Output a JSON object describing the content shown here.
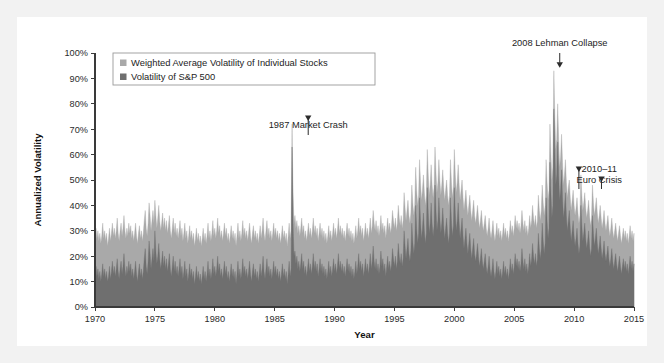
{
  "figure": {
    "background_color": "#f2f2f2",
    "card_color": "#ffffff"
  },
  "chart_data": {
    "type": "area",
    "title": "",
    "xlabel": "Year",
    "ylabel": "Annualized Volatility",
    "xlim": [
      1970,
      2015
    ],
    "ylim": [
      0,
      100
    ],
    "grid": false,
    "legend_position": "top-left",
    "xticks": [
      1970,
      1975,
      1980,
      1985,
      1990,
      1995,
      2000,
      2005,
      2010,
      2015
    ],
    "xtick_labels": [
      "1970",
      "1975",
      "1980",
      "1985",
      "1990",
      "1995",
      "2000",
      "2005",
      "2010",
      "2015"
    ],
    "yticks": [
      0,
      10,
      20,
      30,
      40,
      50,
      60,
      70,
      80,
      90,
      100
    ],
    "ytick_labels": [
      "0%",
      "10%",
      "20%",
      "30%",
      "40%",
      "50%",
      "60%",
      "70%",
      "80%",
      "90%",
      "100%"
    ],
    "colors": {
      "individual_stocks": "#a9a9a9",
      "sp500": "#6f6f6f"
    },
    "series": [
      {
        "name": "Weighted Average Volatility of Individual Stocks",
        "color": "#a9a9a9",
        "values": [
          28,
          31,
          27,
          30,
          26,
          29,
          25,
          28,
          33,
          27,
          30,
          26,
          29,
          24,
          27,
          31,
          26,
          29,
          33,
          28,
          31,
          27,
          30,
          35,
          29,
          26,
          30,
          33,
          28,
          31,
          36,
          30,
          27,
          31,
          28,
          33,
          29,
          32,
          27,
          30,
          26,
          29,
          33,
          28,
          25,
          29,
          32,
          27,
          30,
          26,
          29,
          34,
          38,
          31,
          28,
          33,
          41,
          36,
          30,
          34,
          38,
          33,
          42,
          36,
          31,
          35,
          40,
          34,
          30,
          33,
          37,
          31,
          35,
          30,
          34,
          29,
          32,
          36,
          30,
          27,
          31,
          35,
          29,
          33,
          28,
          31,
          27,
          30,
          34,
          28,
          31,
          26,
          29,
          33,
          27,
          30,
          25,
          28,
          32,
          27,
          30,
          26,
          29,
          24,
          27,
          31,
          26,
          29,
          25,
          28,
          24,
          27,
          31,
          26,
          29,
          25,
          28,
          33,
          27,
          30,
          26,
          29,
          34,
          28,
          31,
          27,
          30,
          35,
          29,
          32,
          27,
          30,
          26,
          29,
          33,
          28,
          31,
          26,
          29,
          25,
          28,
          32,
          27,
          30,
          26,
          29,
          24,
          28,
          33,
          27,
          30,
          26,
          29,
          34,
          28,
          31,
          27,
          30,
          26,
          29,
          33,
          28,
          25,
          29,
          32,
          27,
          30,
          26,
          29,
          25,
          28,
          32,
          27,
          30,
          35,
          29,
          26,
          30,
          34,
          28,
          31,
          27,
          30,
          26,
          29,
          33,
          28,
          31,
          27,
          30,
          26,
          29,
          25,
          28,
          32,
          27,
          30,
          26,
          29,
          24,
          28,
          33,
          27,
          30,
          72,
          45,
          33,
          36,
          31,
          34,
          29,
          32,
          28,
          31,
          35,
          29,
          32,
          27,
          30,
          26,
          29,
          33,
          28,
          31,
          27,
          30,
          35,
          29,
          32,
          28,
          31,
          26,
          29,
          33,
          28,
          31,
          27,
          30,
          26,
          29,
          25,
          28,
          32,
          27,
          30,
          26,
          29,
          33,
          28,
          31,
          27,
          30,
          35,
          29,
          32,
          28,
          31,
          27,
          30,
          26,
          29,
          33,
          28,
          31,
          27,
          30,
          26,
          29,
          25,
          28,
          32,
          27,
          30,
          35,
          29,
          32,
          28,
          31,
          26,
          29,
          33,
          28,
          31,
          27,
          30,
          35,
          29,
          32,
          38,
          33,
          30,
          34,
          29,
          32,
          28,
          31,
          36,
          30,
          33,
          29,
          32,
          27,
          31,
          35,
          30,
          33,
          29,
          32,
          38,
          34,
          31,
          35,
          30,
          33,
          40,
          35,
          32,
          36,
          31,
          34,
          45,
          39,
          34,
          38,
          42,
          36,
          33,
          37,
          48,
          41,
          36,
          40,
          55,
          46,
          40,
          44,
          58,
          49,
          42,
          46,
          52,
          45,
          40,
          44,
          62,
          52,
          44,
          48,
          56,
          48,
          43,
          47,
          63,
          53,
          45,
          49,
          58,
          50,
          44,
          48,
          54,
          47,
          42,
          46,
          50,
          44,
          40,
          44,
          58,
          49,
          43,
          47,
          62,
          52,
          45,
          49,
          56,
          48,
          42,
          46,
          50,
          43,
          38,
          42,
          46,
          40,
          36,
          40,
          44,
          38,
          34,
          38,
          42,
          36,
          33,
          36,
          40,
          35,
          31,
          34,
          38,
          33,
          30,
          33,
          36,
          31,
          28,
          31,
          35,
          30,
          27,
          30,
          34,
          29,
          26,
          29,
          33,
          28,
          31,
          27,
          30,
          26,
          29,
          33,
          28,
          31,
          27,
          30,
          26,
          29,
          34,
          29,
          32,
          28,
          31,
          36,
          31,
          34,
          30,
          33,
          29,
          32,
          38,
          33,
          30,
          34,
          29,
          32,
          28,
          31,
          36,
          31,
          34,
          40,
          35,
          32,
          36,
          31,
          34,
          44,
          38,
          34,
          38,
          48,
          41,
          36,
          40,
          58,
          49,
          42,
          46,
          72,
          60,
          50,
          55,
          93,
          76,
          62,
          66,
          80,
          66,
          55,
          59,
          68,
          57,
          48,
          52,
          58,
          49,
          43,
          47,
          50,
          43,
          38,
          42,
          46,
          40,
          36,
          39,
          43,
          37,
          33,
          36,
          52,
          44,
          38,
          41,
          45,
          39,
          35,
          38,
          42,
          36,
          32,
          35,
          48,
          41,
          36,
          39,
          43,
          37,
          33,
          36,
          40,
          35,
          31,
          34,
          38,
          33,
          30,
          33,
          36,
          31,
          28,
          31,
          35,
          30,
          27,
          30,
          33,
          29,
          26,
          29,
          32,
          28,
          25,
          28,
          31,
          27,
          30,
          26,
          29,
          25,
          28,
          32,
          27,
          30,
          26,
          29
        ]
      },
      {
        "name": "Volatility of S&P 500",
        "color": "#6f6f6f",
        "values": [
          13,
          16,
          12,
          15,
          11,
          14,
          10,
          13,
          17,
          12,
          15,
          11,
          14,
          10,
          12,
          16,
          11,
          14,
          18,
          13,
          16,
          12,
          15,
          19,
          14,
          11,
          15,
          18,
          13,
          16,
          21,
          15,
          12,
          16,
          13,
          18,
          14,
          17,
          12,
          15,
          11,
          14,
          18,
          13,
          10,
          14,
          17,
          12,
          15,
          11,
          14,
          19,
          23,
          16,
          13,
          18,
          26,
          21,
          15,
          19,
          23,
          18,
          30,
          22,
          17,
          20,
          25,
          19,
          15,
          18,
          22,
          16,
          20,
          15,
          19,
          14,
          17,
          21,
          15,
          12,
          16,
          20,
          14,
          18,
          13,
          16,
          12,
          15,
          19,
          13,
          16,
          11,
          14,
          18,
          12,
          15,
          10,
          13,
          17,
          12,
          15,
          11,
          14,
          9,
          12,
          16,
          11,
          14,
          10,
          13,
          9,
          12,
          16,
          11,
          14,
          10,
          13,
          18,
          12,
          15,
          11,
          14,
          19,
          13,
          16,
          12,
          15,
          20,
          14,
          17,
          12,
          15,
          11,
          14,
          18,
          13,
          16,
          11,
          14,
          10,
          13,
          17,
          12,
          15,
          11,
          14,
          9,
          13,
          18,
          12,
          15,
          11,
          14,
          19,
          13,
          16,
          12,
          15,
          11,
          14,
          18,
          13,
          10,
          14,
          17,
          12,
          15,
          11,
          14,
          10,
          13,
          17,
          12,
          15,
          20,
          14,
          11,
          15,
          19,
          13,
          16,
          12,
          15,
          11,
          14,
          18,
          13,
          16,
          12,
          15,
          11,
          14,
          10,
          13,
          17,
          12,
          15,
          11,
          14,
          9,
          13,
          18,
          12,
          15,
          63,
          33,
          20,
          22,
          17,
          20,
          15,
          18,
          14,
          17,
          21,
          15,
          18,
          13,
          16,
          12,
          15,
          19,
          14,
          17,
          13,
          16,
          21,
          15,
          18,
          14,
          17,
          12,
          15,
          19,
          14,
          17,
          13,
          16,
          12,
          15,
          11,
          14,
          18,
          13,
          16,
          12,
          15,
          19,
          14,
          17,
          13,
          16,
          21,
          15,
          18,
          14,
          17,
          13,
          16,
          12,
          15,
          19,
          14,
          17,
          13,
          16,
          12,
          15,
          11,
          14,
          18,
          13,
          16,
          21,
          15,
          18,
          14,
          17,
          12,
          15,
          19,
          14,
          17,
          13,
          16,
          21,
          15,
          18,
          24,
          18,
          15,
          19,
          14,
          17,
          13,
          16,
          22,
          16,
          19,
          14,
          17,
          12,
          16,
          20,
          15,
          18,
          14,
          17,
          23,
          19,
          16,
          20,
          15,
          18,
          25,
          20,
          17,
          21,
          16,
          19,
          30,
          24,
          19,
          23,
          27,
          21,
          18,
          22,
          33,
          26,
          21,
          25,
          40,
          31,
          25,
          29,
          43,
          34,
          27,
          31,
          37,
          30,
          25,
          29,
          47,
          37,
          29,
          33,
          41,
          33,
          28,
          32,
          48,
          38,
          30,
          34,
          43,
          35,
          29,
          33,
          39,
          32,
          27,
          31,
          35,
          29,
          25,
          29,
          43,
          34,
          28,
          32,
          47,
          37,
          30,
          34,
          41,
          33,
          27,
          31,
          35,
          28,
          23,
          27,
          31,
          25,
          21,
          25,
          29,
          23,
          19,
          23,
          27,
          21,
          18,
          21,
          25,
          20,
          16,
          19,
          23,
          18,
          15,
          18,
          21,
          16,
          13,
          16,
          20,
          15,
          12,
          15,
          19,
          14,
          11,
          14,
          18,
          13,
          16,
          12,
          15,
          11,
          14,
          18,
          13,
          16,
          12,
          15,
          11,
          14,
          19,
          14,
          17,
          13,
          16,
          21,
          16,
          19,
          15,
          18,
          14,
          17,
          23,
          18,
          15,
          19,
          14,
          17,
          13,
          16,
          21,
          16,
          19,
          25,
          20,
          17,
          21,
          16,
          19,
          29,
          23,
          19,
          23,
          33,
          26,
          21,
          25,
          43,
          34,
          27,
          31,
          57,
          45,
          35,
          40,
          78,
          62,
          48,
          52,
          65,
          52,
          42,
          46,
          54,
          43,
          35,
          39,
          45,
          36,
          30,
          34,
          38,
          31,
          26,
          30,
          34,
          28,
          24,
          27,
          31,
          25,
          21,
          24,
          40,
          32,
          26,
          29,
          33,
          27,
          23,
          26,
          30,
          24,
          20,
          23,
          36,
          29,
          24,
          27,
          31,
          25,
          21,
          24,
          28,
          23,
          19,
          22,
          26,
          21,
          18,
          21,
          24,
          19,
          16,
          19,
          23,
          18,
          15,
          18,
          21,
          17,
          14,
          17,
          20,
          16,
          13,
          16,
          19,
          15,
          18,
          14,
          17,
          13,
          16,
          20,
          15,
          18,
          14,
          17
        ]
      }
    ],
    "annotations": [
      {
        "id": "crash-1987",
        "text": "1987 Market Crash",
        "year": 1987.8,
        "value": 72
      },
      {
        "id": "lehman-2008",
        "text": "2008 Lehman Collapse",
        "year": 2008.8,
        "value": 93
      },
      {
        "id": "euro-crisis",
        "text_line1": "2010–11",
        "text_line2": "Euro Crisis",
        "year_a": 2010.4,
        "value_a": 52,
        "year_b": 2011.7,
        "value_b": 48
      }
    ]
  }
}
